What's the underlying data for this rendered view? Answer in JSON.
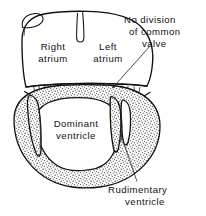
{
  "figure": {
    "background_color": "#ffffff",
    "ink_color": "#111111",
    "stipple_color": "#5a5a5a"
  },
  "labels": {
    "right_atrium_line1": "Right",
    "right_atrium_line2": "atrium",
    "left_atrium_line1": "Left",
    "left_atrium_line2": "atrium",
    "no_division_line1": "No division",
    "no_division_line2": "of common",
    "no_division_line3": "valve",
    "dominant_line1": "Dominant",
    "dominant_line2": "ventricle",
    "rudimentary_line1": "Rudimentary",
    "rudimentary_line2": "ventricle"
  },
  "structures": [
    {
      "name": "atrial-chamber",
      "label": "Common atrial chamber"
    },
    {
      "name": "atrial-appendage",
      "label": "Atrial appendage lobe"
    },
    {
      "name": "septal-remnant",
      "label": "Atrial septal remnant"
    },
    {
      "name": "common-valve",
      "label": "Common atrioventricular valve"
    },
    {
      "name": "dominant-ventricle",
      "label": "Dominant ventricle cavity"
    },
    {
      "name": "rudimentary-ventricle",
      "label": "Rudimentary ventricle pocket"
    },
    {
      "name": "myocardial-wall",
      "label": "Stippled myocardial wall"
    }
  ],
  "leaders": [
    {
      "name": "valve-leader",
      "points_to": "common-valve",
      "has_arrowhead": true
    },
    {
      "name": "rudimentary-leader",
      "points_to": "rudimentary-ventricle",
      "has_arrowhead": false
    }
  ]
}
